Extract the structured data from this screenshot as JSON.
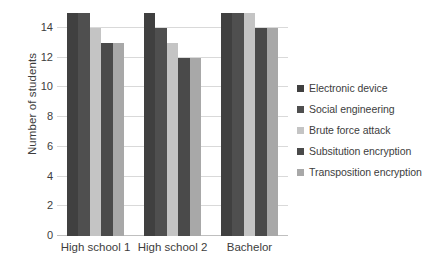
{
  "chart_data": {
    "type": "bar",
    "title": "",
    "subtitle": "",
    "xlabel": "",
    "ylabel": "Number of students",
    "categories": [
      "High school 1",
      "High school 2",
      "Bachelor"
    ],
    "series": [
      {
        "name": "Electronic device",
        "color": "#404040",
        "values": [
          15,
          15,
          15
        ]
      },
      {
        "name": "Social engineering",
        "color": "#4f4f4f",
        "values": [
          15,
          14,
          15
        ]
      },
      {
        "name": "Brute force attack",
        "color": "#c4c4c4",
        "values": [
          14,
          13,
          15
        ]
      },
      {
        "name": "Subsitution encryption",
        "color": "#4a4a4a",
        "values": [
          13,
          12,
          14
        ]
      },
      {
        "name": "Transposition encryption",
        "color": "#a8a8a8",
        "values": [
          13,
          12,
          14
        ]
      }
    ],
    "ylim": [
      0,
      15
    ],
    "y_ticks": [
      0,
      2,
      4,
      6,
      8,
      10,
      12,
      14
    ],
    "y_tick_labels": [
      "0",
      "2",
      "4",
      "6",
      "8",
      "10",
      "12",
      "14"
    ],
    "grid": true,
    "grid_axis": "y",
    "legend_position": "right",
    "background_color": "#ffffff",
    "grid_color": "#d9d9d9",
    "text_color": "#3d3d3d"
  }
}
